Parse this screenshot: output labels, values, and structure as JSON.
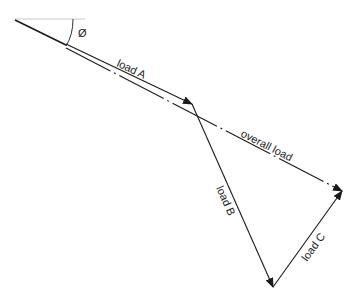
{
  "diagram": {
    "angle_symbol": "Ø",
    "labels": {
      "load_a": "load A",
      "load_b": "load B",
      "load_c": "load C",
      "overall": "overall load"
    },
    "colors": {
      "line": "#1a1a1a",
      "reference": "#bbbbbb"
    }
  }
}
